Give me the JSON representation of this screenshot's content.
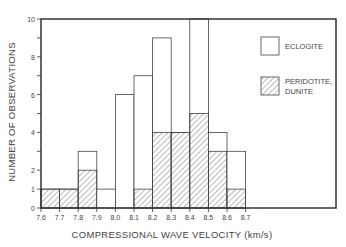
{
  "chart_data": {
    "type": "bar",
    "stacked": true,
    "title": "",
    "xlabel": "COMPRESSIONAL WAVE VELOCITY  (km/s)",
    "ylabel": "NUMBER OF OBSERVATIONS",
    "x_tick_labels": [
      "7.6",
      "7.7",
      "7.8",
      "7.9",
      "8.0",
      "8.1",
      "8.2",
      "8.3",
      "8.4",
      "8.5",
      "8.6",
      "8.7"
    ],
    "y_tick_labels": [
      "0",
      "1",
      "2",
      "4",
      "6",
      "8",
      "10"
    ],
    "y_ticks": [
      0,
      1,
      2,
      3,
      4,
      5,
      6,
      7,
      8,
      9,
      10
    ],
    "ylim": [
      0,
      10
    ],
    "xlim": [
      7.6,
      8.7
    ],
    "categories": [
      "7.6-7.7",
      "7.7-7.8",
      "7.8-7.9",
      "7.9-8.0",
      "8.0-8.1",
      "8.1-8.2",
      "8.2-8.3",
      "8.3-8.4",
      "8.4-8.5",
      "8.5-8.6",
      "8.6-8.7"
    ],
    "series": [
      {
        "name": "PERIDOTITE, DUNITE",
        "pattern": "hatched",
        "values": [
          1,
          1,
          2,
          0,
          0,
          1,
          4,
          4,
          5,
          3,
          1
        ]
      },
      {
        "name": "ECLOGITE",
        "pattern": "open",
        "values": [
          0,
          0,
          1,
          1,
          6,
          6,
          5,
          0,
          5,
          1,
          2
        ]
      }
    ],
    "totals": [
      1,
      1,
      3,
      1,
      6,
      7,
      9,
      4,
      10,
      4,
      3
    ],
    "legend": [
      {
        "label": "ECLOGITE",
        "pattern": "open"
      },
      {
        "label_line1": "PERIDOTITE,",
        "label_line2": "DUNITE",
        "pattern": "hatched"
      }
    ],
    "legend_position": "upper right, inside plot",
    "grid": false,
    "colors": {
      "line": "#333333",
      "hatch": "#555555",
      "background": "#ffffff"
    }
  }
}
